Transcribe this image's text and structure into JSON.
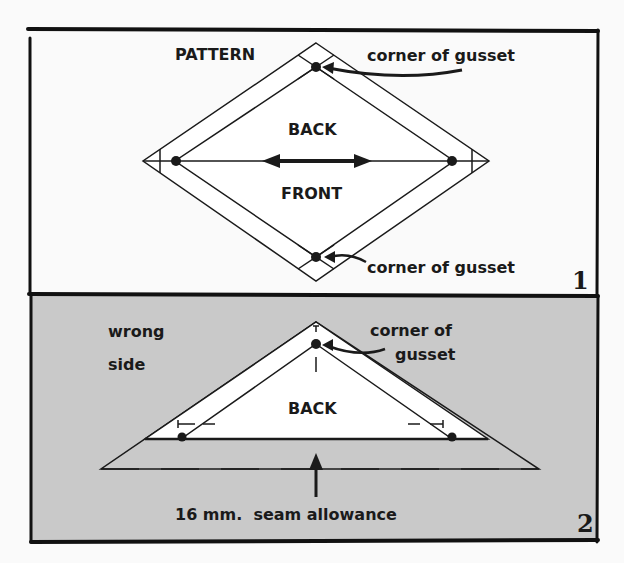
{
  "panel1": {
    "number": "1",
    "title": "PATTERN",
    "back_label": "BACK",
    "front_label": "FRONT",
    "top_annotation": "corner of gusset",
    "bottom_annotation": "corner of gusset",
    "background": "#fafafa"
  },
  "panel2": {
    "number": "2",
    "side_label_line1": "wrong",
    "side_label_line2": "side",
    "back_label": "BACK",
    "annotation_line1": "corner of",
    "annotation_line2": "gusset",
    "seam_label": "16 mm.  seam allowance",
    "background": "#c9c9c9"
  }
}
